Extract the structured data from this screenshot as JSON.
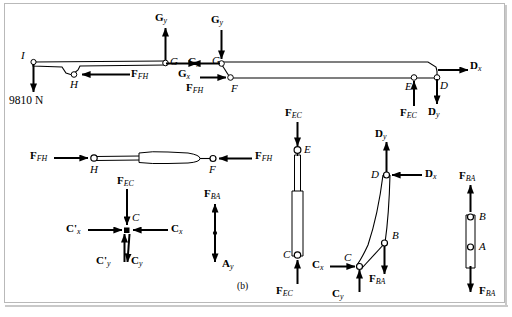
{
  "figure": {
    "caption": "(b)",
    "background": "#ffffff",
    "line_color": "#000000",
    "border_color": "#b9b9b9"
  },
  "labels": {
    "load": "9810 N",
    "F": "F",
    "G": "G",
    "H": "H",
    "I": "I",
    "E": "E",
    "D": "D",
    "C": "C",
    "B": "B",
    "A": "A"
  },
  "forces": {
    "Gy": {
      "symbol": "G",
      "sub": "y"
    },
    "Gx": {
      "symbol": "G",
      "sub": "x"
    },
    "FFH": {
      "symbol": "F",
      "sub": "FH"
    },
    "FEC": {
      "symbol": "F",
      "sub": "EC"
    },
    "FBA": {
      "symbol": "F",
      "sub": "BA"
    },
    "Dx": {
      "symbol": "D",
      "sub": "x"
    },
    "Dy": {
      "symbol": "D",
      "sub": "y"
    },
    "Cx": {
      "symbol": "C",
      "sub": "x"
    },
    "Cy": {
      "symbol": "C",
      "sub": "y"
    },
    "Cxp": {
      "symbol": "C'",
      "sub": "x"
    },
    "Cyp": {
      "symbol": "C'",
      "sub": "y"
    },
    "Ay": {
      "symbol": "A",
      "sub": "y"
    }
  },
  "bodies": [
    {
      "name": "upper-boom-IGH",
      "points": [
        "I",
        "H",
        "G"
      ]
    },
    {
      "name": "lower-boom-GFED",
      "points": [
        "G",
        "F",
        "E",
        "D"
      ]
    },
    {
      "name": "member-HF-cylinder",
      "points": [
        "H",
        "F"
      ]
    },
    {
      "name": "joint-C",
      "points": [
        "C"
      ]
    },
    {
      "name": "member-EC-cylinder",
      "points": [
        "E",
        "C"
      ]
    },
    {
      "name": "member-DCB-link",
      "points": [
        "D",
        "B",
        "C"
      ]
    },
    {
      "name": "member-AB-link",
      "points": [
        "B",
        "A"
      ]
    },
    {
      "name": "pin-A-reaction",
      "points": [
        "A"
      ]
    }
  ]
}
